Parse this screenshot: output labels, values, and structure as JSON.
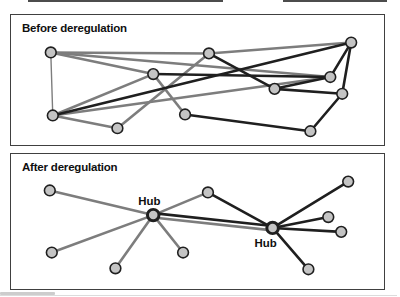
{
  "colors": {
    "edge_gray": "#7d7d7d",
    "edge_black": "#1f1f1f",
    "node_fill": "#c4c4c4",
    "node_stroke": "#1f1f1f",
    "panel_border": "#404040",
    "title_color": "#0f0f0f",
    "background": "#ffffff"
  },
  "panels": [
    {
      "id": "before",
      "title": "Before deregulation",
      "nodes": [
        {
          "id": "A",
          "x": 50,
          "y": 52
        },
        {
          "id": "B",
          "x": 209,
          "y": 53
        },
        {
          "id": "C",
          "x": 352,
          "y": 42
        },
        {
          "id": "D",
          "x": 153,
          "y": 74
        },
        {
          "id": "E",
          "x": 331,
          "y": 77
        },
        {
          "id": "F",
          "x": 275,
          "y": 89
        },
        {
          "id": "G",
          "x": 343,
          "y": 94
        },
        {
          "id": "H",
          "x": 52,
          "y": 116
        },
        {
          "id": "I",
          "x": 185,
          "y": 115
        },
        {
          "id": "J",
          "x": 117,
          "y": 129
        },
        {
          "id": "K",
          "x": 311,
          "y": 132
        }
      ],
      "edges": [
        {
          "from": "A",
          "to": "B",
          "color": "gray"
        },
        {
          "from": "B",
          "to": "C",
          "color": "gray"
        },
        {
          "from": "A",
          "to": "D",
          "color": "gray"
        },
        {
          "from": "A",
          "to": "E",
          "color": "gray"
        },
        {
          "from": "A",
          "to": "H",
          "color": "gray",
          "w": 1.4
        },
        {
          "from": "H",
          "to": "D",
          "color": "gray"
        },
        {
          "from": "H",
          "to": "E",
          "color": "gray"
        },
        {
          "from": "H",
          "to": "J",
          "color": "gray"
        },
        {
          "from": "D",
          "to": "I",
          "color": "gray"
        },
        {
          "from": "J",
          "to": "B",
          "color": "gray"
        },
        {
          "from": "H",
          "to": "C",
          "color": "black"
        },
        {
          "from": "B",
          "to": "F",
          "color": "black"
        },
        {
          "from": "D",
          "to": "E",
          "color": "black"
        },
        {
          "from": "F",
          "to": "E",
          "color": "black"
        },
        {
          "from": "F",
          "to": "G",
          "color": "black"
        },
        {
          "from": "E",
          "to": "C",
          "color": "black"
        },
        {
          "from": "G",
          "to": "C",
          "color": "black"
        },
        {
          "from": "G",
          "to": "K",
          "color": "black"
        },
        {
          "from": "I",
          "to": "K",
          "color": "black"
        }
      ],
      "labels": []
    },
    {
      "id": "after",
      "title": "After deregulation",
      "nodes": [
        {
          "id": "H1",
          "x": 153,
          "y": 215,
          "hub": true
        },
        {
          "id": "H2",
          "x": 273,
          "y": 228,
          "hub": true
        },
        {
          "id": "LT",
          "x": 49,
          "y": 190
        },
        {
          "id": "LB",
          "x": 51,
          "y": 253
        },
        {
          "id": "B1",
          "x": 115,
          "y": 269
        },
        {
          "id": "B2",
          "x": 183,
          "y": 253
        },
        {
          "id": "TM",
          "x": 208,
          "y": 192
        },
        {
          "id": "TR",
          "x": 349,
          "y": 181
        },
        {
          "id": "R1",
          "x": 329,
          "y": 217
        },
        {
          "id": "R2",
          "x": 342,
          "y": 232
        },
        {
          "id": "BR",
          "x": 309,
          "y": 270
        }
      ],
      "edges": [
        {
          "from": "H1",
          "to": "LT",
          "color": "gray"
        },
        {
          "from": "H1",
          "to": "LB",
          "color": "gray"
        },
        {
          "from": "H1",
          "to": "B1",
          "color": "gray"
        },
        {
          "from": "H1",
          "to": "B2",
          "color": "gray"
        },
        {
          "from": "H1",
          "to": "TM",
          "color": "gray"
        },
        {
          "from": "H1",
          "to": "H2",
          "color": "gray",
          "dy": 2.5
        },
        {
          "from": "H1",
          "to": "H2",
          "color": "black",
          "dy": -2
        },
        {
          "from": "H2",
          "to": "TM",
          "color": "black"
        },
        {
          "from": "H2",
          "to": "TR",
          "color": "black"
        },
        {
          "from": "H2",
          "to": "R1",
          "color": "black"
        },
        {
          "from": "H2",
          "to": "R2",
          "color": "black"
        },
        {
          "from": "H2",
          "to": "BR",
          "color": "black"
        }
      ],
      "labels": [
        {
          "text": "Hub",
          "x": 149,
          "y": 205
        },
        {
          "text": "Hub",
          "x": 266,
          "y": 247
        }
      ]
    }
  ]
}
